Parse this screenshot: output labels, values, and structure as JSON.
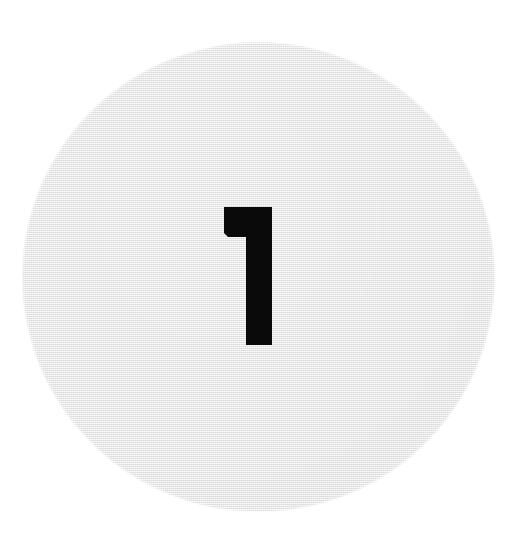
{
  "canvas": {
    "width": 525,
    "height": 534,
    "background_color": "#ffffff"
  },
  "disc": {
    "shape": "circle",
    "fill_color": "#eaeaea",
    "edge_color": "#e0e0e0",
    "texture": "fine woven canvas grain",
    "center_x": 258,
    "center_y": 277,
    "diameter_x": 473,
    "diameter_y": 470
  },
  "numeral": {
    "value": "1",
    "label": "1",
    "color": "#0a0a0a",
    "style": "bold geometric sans-serif, flag top-left, no base serif",
    "x": 222,
    "y": 205,
    "width": 54,
    "height": 142
  }
}
